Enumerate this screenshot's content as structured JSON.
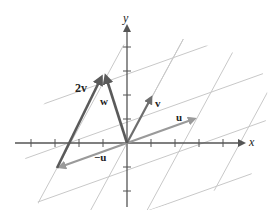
{
  "figure": {
    "axes": {
      "x_label": "x",
      "y_label": "y"
    },
    "vectors": [
      {
        "id": "u",
        "label": "u",
        "color": "#9a9a9a"
      },
      {
        "id": "v",
        "label": "v",
        "color": "#6e6e6e"
      },
      {
        "id": "neg_u",
        "label": "−u",
        "color": "#9a9a9a"
      },
      {
        "id": "two_v",
        "label": "2v",
        "color": "#5a5a5a"
      },
      {
        "id": "w",
        "label": "w",
        "color": "#5a5a5a"
      }
    ],
    "relation": "w = 2v − u",
    "colors": {
      "axis": "#555555",
      "grid": "#c8c8c8",
      "text": "#222222"
    }
  }
}
